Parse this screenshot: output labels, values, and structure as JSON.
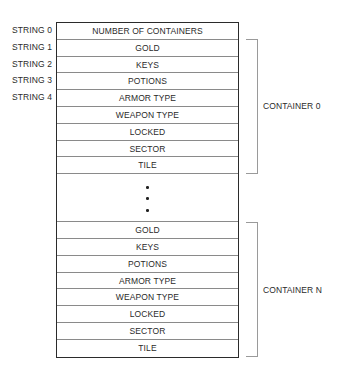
{
  "string_labels": [
    "STRING 0",
    "STRING 1",
    "STRING 2",
    "STRING 3",
    "STRING 4"
  ],
  "header_row": "NUMBER OF CONTAINERS",
  "container_0": {
    "label": "CONTAINER 0",
    "fields": [
      "GOLD",
      "KEYS",
      "POTIONS",
      "ARMOR TYPE",
      "WEAPON TYPE",
      "LOCKED",
      "SECTOR",
      "TILE"
    ]
  },
  "ellipsis": "vertical-ellipsis",
  "container_n": {
    "label": "CONTAINER N",
    "fields": [
      "GOLD",
      "KEYS",
      "POTIONS",
      "ARMOR TYPE",
      "WEAPON TYPE",
      "LOCKED",
      "SECTOR",
      "TILE"
    ]
  }
}
